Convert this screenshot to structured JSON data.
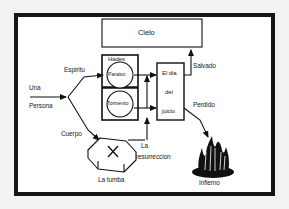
{
  "diagram": {
    "language": "es",
    "frame": {
      "border_color": "#151515",
      "background": "#ffffff",
      "page_background": "#f2f2f0"
    },
    "nodes": [
      {
        "id": "cielo",
        "label": "Cielo",
        "shape": "rectangle",
        "x": 102,
        "y": 19,
        "w": 100,
        "h": 28
      },
      {
        "id": "hades",
        "label": "Hades",
        "shape": "rectangle",
        "x": 102,
        "y": 55,
        "w": 36,
        "h": 65
      },
      {
        "id": "paraiso",
        "label": "Paraiso",
        "shape": "circle",
        "x": 106,
        "y": 62,
        "w": 27,
        "h": 27
      },
      {
        "id": "tormento",
        "label": "Tormento",
        "shape": "circle",
        "x": 106,
        "y": 91,
        "w": 27,
        "h": 27
      },
      {
        "id": "juicio",
        "label": "El dia del juicio",
        "label_lines": [
          "El dia",
          "del",
          "juicio"
        ],
        "shape": "rectangle",
        "x": 157,
        "y": 63,
        "w": 27,
        "h": 57
      },
      {
        "id": "tumba",
        "label": "La tumba",
        "shape": "coffin",
        "x": 83,
        "y": 136,
        "w": 56,
        "h": 36
      },
      {
        "id": "infierno",
        "label": "Infierno",
        "shape": "flames",
        "x": 192,
        "y": 140,
        "w": 42,
        "h": 36
      }
    ],
    "edge_labels": [
      {
        "id": "una",
        "text": "Una",
        "x": 29,
        "y": 87
      },
      {
        "id": "persona",
        "text": "Persona",
        "x": 29,
        "y": 105
      },
      {
        "id": "espiritu",
        "text": "Espiritu",
        "x": 64,
        "y": 69
      },
      {
        "id": "cuerpo",
        "text": "Cuerpo",
        "x": 62,
        "y": 133
      },
      {
        "id": "resurreccion1",
        "text": "La",
        "x": 140,
        "y": 145
      },
      {
        "id": "resurreccion2",
        "text": "resurreccion",
        "x": 136,
        "y": 156
      },
      {
        "id": "salvado",
        "text": "Salvado",
        "x": 192,
        "y": 65
      },
      {
        "id": "perdido",
        "text": "Perdido",
        "x": 192,
        "y": 104
      }
    ]
  }
}
